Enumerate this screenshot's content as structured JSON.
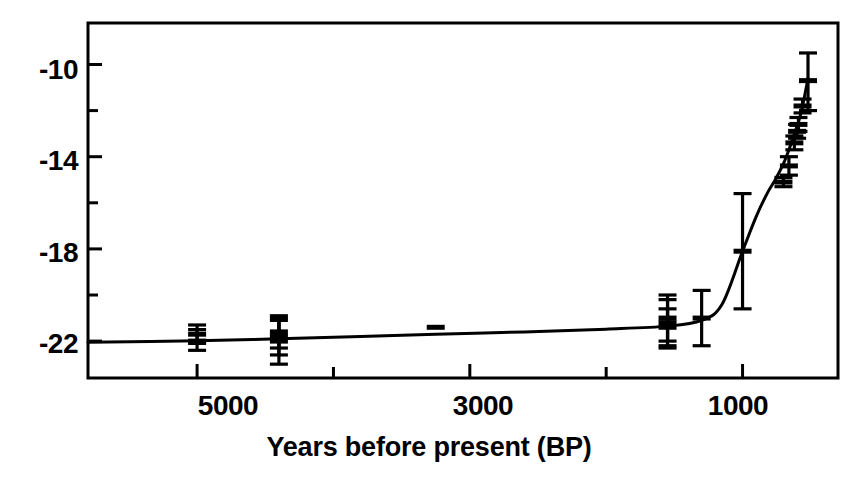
{
  "chart_data": {
    "type": "scatter",
    "title": "",
    "subtitle": "",
    "xlabel": "Years before present (BP)",
    "ylabel": "",
    "grid": false,
    "legend": "none",
    "x_axis": {
      "reversed": true,
      "min": 5800,
      "max": 300,
      "major_ticks": [
        5000,
        3000,
        1000
      ],
      "major_tick_labels": [
        "5000",
        "3000",
        "1000"
      ],
      "minor_ticks": [
        4000,
        2000
      ],
      "all_ticks": [
        5000,
        4000,
        3000,
        2000,
        1000
      ]
    },
    "y_axis": {
      "min": -23.6,
      "max": -8.2,
      "major_ticks": [
        -10,
        -14,
        -18,
        -22
      ],
      "major_tick_labels": [
        "-10",
        "-14",
        "-18",
        "-22"
      ],
      "minor_ticks": [
        -12,
        -16,
        -20
      ],
      "all_ticks": [
        -10,
        -12,
        -14,
        -16,
        -18,
        -20,
        -22
      ]
    },
    "points": [
      {
        "x": 5000,
        "y": -22.0,
        "yerr_low": -22.4,
        "yerr_high": -21.5
      },
      {
        "x": 5000,
        "y": -21.7,
        "yerr_low": -22.1,
        "yerr_high": -21.3
      },
      {
        "x": 4400,
        "y": -22.0,
        "yerr_low": -23.0,
        "yerr_high": -21.0
      },
      {
        "x": 4400,
        "y": -21.8,
        "yerr_low": -22.6,
        "yerr_high": -21.1
      },
      {
        "x": 4400,
        "y": -21.6,
        "yerr_low": -22.3,
        "yerr_high": -20.9
      },
      {
        "x": 3250,
        "y": -21.4,
        "yerr_low": null,
        "yerr_high": null
      },
      {
        "x": 1550,
        "y": -21.2,
        "yerr_low": -22.3,
        "yerr_high": -20.2
      },
      {
        "x": 1550,
        "y": -21.0,
        "yerr_low": -22.0,
        "yerr_high": -20.0
      },
      {
        "x": 1550,
        "y": -21.4,
        "yerr_low": -22.2,
        "yerr_high": -20.6
      },
      {
        "x": 1300,
        "y": -21.0,
        "yerr_low": -22.2,
        "yerr_high": -19.8
      },
      {
        "x": 1000,
        "y": -18.1,
        "yerr_low": -20.6,
        "yerr_high": -15.6
      },
      {
        "x": 700,
        "y": -15.1,
        "yerr_low": -15.3,
        "yerr_high": -14.9
      },
      {
        "x": 660,
        "y": -14.4,
        "yerr_low": -14.8,
        "yerr_high": -14.0
      },
      {
        "x": 620,
        "y": -13.4,
        "yerr_low": -13.7,
        "yerr_high": -13.1
      },
      {
        "x": 600,
        "y": -12.9,
        "yerr_low": -13.2,
        "yerr_high": -12.6
      },
      {
        "x": 590,
        "y": -12.6,
        "yerr_low": -12.9,
        "yerr_high": -12.3
      },
      {
        "x": 560,
        "y": -11.8,
        "yerr_low": -12.1,
        "yerr_high": -11.5
      },
      {
        "x": 520,
        "y": -10.7,
        "yerr_low": -12.0,
        "yerr_high": -9.5
      }
    ],
    "fit_curve": {
      "description": "smooth monotonic trend line rising sharply toward present",
      "x": [
        5800,
        5000,
        4400,
        3800,
        3250,
        2600,
        2000,
        1550,
        1300,
        1150,
        1000,
        900,
        820,
        760,
        700,
        660,
        620,
        590,
        560,
        520
      ],
      "y": [
        -22.05,
        -21.98,
        -21.9,
        -21.8,
        -21.7,
        -21.6,
        -21.48,
        -21.35,
        -21.1,
        -20.4,
        -18.1,
        -16.6,
        -15.6,
        -15.0,
        -14.3,
        -13.7,
        -13.0,
        -12.5,
        -11.8,
        -10.6
      ]
    }
  },
  "axes": {
    "y_labels": [
      "-10",
      "-14",
      "-18",
      "-22"
    ],
    "x_labels": [
      "5000",
      "3000",
      "1000"
    ],
    "x_title": "Years before present (BP)"
  },
  "style": {
    "line_color": "#000000",
    "marker_color": "#000000",
    "frame_color": "#000000",
    "background": "#ffffff"
  }
}
